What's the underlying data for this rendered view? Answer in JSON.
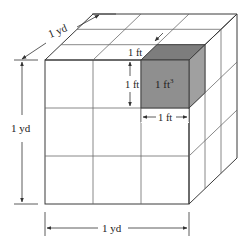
{
  "diagram": {
    "colors": {
      "background": "#ffffff",
      "line": "#3a3a3a",
      "grid": "#6a6a6a",
      "shaded_front": "#8f8f8f",
      "shaded_top": "#7d7d7d",
      "shaded_side": "#a0a0a0"
    },
    "labels": {
      "depth_yd": "1 yd",
      "height_yd": "1 yd",
      "width_yd": "1 yd",
      "cell_depth_ft": "1 ft",
      "cell_height_ft": "1 ft",
      "cell_width_ft": "1 ft",
      "cell_volume": "1 ft",
      "cell_volume_exp": "3"
    },
    "grid": {
      "divisions_per_edge": 3,
      "total_cells": 27
    }
  }
}
